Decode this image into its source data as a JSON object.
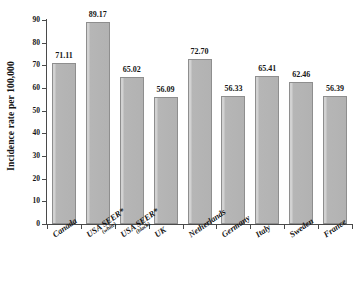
{
  "chart_data": {
    "type": "bar",
    "title": "",
    "xlabel": "",
    "ylabel": "Incidence rate per 100,000",
    "ylim": [
      0,
      90
    ],
    "ytick_labels": [
      "0",
      "10",
      "20",
      "30",
      "40",
      "50",
      "60",
      "70",
      "80",
      "90"
    ],
    "ytick_values": [
      0,
      10,
      20,
      30,
      40,
      50,
      60,
      70,
      80,
      90
    ],
    "grid": false,
    "legend": false,
    "categories": [
      "Canada",
      "USA SEER*",
      "USA SEER*",
      "UK",
      "Netherlands",
      "Germany",
      "Italy",
      "Sweden",
      "France"
    ],
    "category_sublabels": [
      "",
      "(white)",
      "(black)",
      "",
      "",
      "",
      "",
      "",
      ""
    ],
    "values": [
      71.11,
      89.17,
      65.02,
      56.09,
      72.7,
      56.33,
      65.41,
      62.46,
      56.39
    ],
    "value_labels": [
      "71.11",
      "89.17",
      "65.02",
      "56.09",
      "72.70",
      "56.33",
      "65.41",
      "62.46",
      "56.39"
    ],
    "bar_color": "#b2b2b2",
    "bar_edge_color": "#8e8e8e",
    "axis_color": "#4a4a4a",
    "background_color": "#ffffff"
  }
}
